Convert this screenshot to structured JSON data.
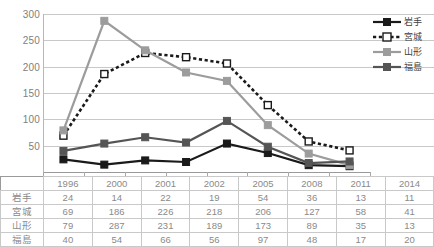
{
  "chart_data": {
    "type": "line",
    "title": "",
    "xlabel": "",
    "ylabel": "",
    "categories": [
      "1996",
      "2000",
      "2001",
      "2002",
      "2005",
      "2008",
      "2011",
      "2014"
    ],
    "ylim": [
      0,
      300
    ],
    "yticks": [
      50,
      100,
      150,
      200,
      250,
      300
    ],
    "grid": true,
    "legend_position": "right",
    "series": [
      {
        "name": "岩手",
        "values": [
          24,
          14,
          22,
          19,
          54,
          36,
          13,
          11
        ],
        "color": "#1a1a1a",
        "style": "solid",
        "marker": "filled-square"
      },
      {
        "name": "宮城",
        "values": [
          69,
          186,
          226,
          218,
          206,
          127,
          58,
          41
        ],
        "color": "#1a1a1a",
        "style": "dotted",
        "marker": "open-square"
      },
      {
        "name": "山形",
        "values": [
          79,
          287,
          231,
          189,
          173,
          89,
          35,
          13
        ],
        "color": "#9c9c9c",
        "style": "solid",
        "marker": "filled-square"
      },
      {
        "name": "福島",
        "values": [
          40,
          54,
          66,
          56,
          97,
          48,
          17,
          20
        ],
        "color": "#555555",
        "style": "solid",
        "marker": "filled-square"
      }
    ]
  },
  "legend": {
    "items": [
      {
        "label": "岩手"
      },
      {
        "label": "宮城"
      },
      {
        "label": "山形"
      },
      {
        "label": "福島"
      }
    ]
  },
  "table": {
    "corner_label": "",
    "columns": [
      "1996",
      "2000",
      "2001",
      "2002",
      "2005",
      "2008",
      "2011",
      "2014"
    ],
    "rows": [
      {
        "label": "岩手",
        "values": [
          "24",
          "14",
          "22",
          "19",
          "54",
          "36",
          "13",
          "11"
        ]
      },
      {
        "label": "宮城",
        "values": [
          "69",
          "186",
          "226",
          "218",
          "206",
          "127",
          "58",
          "41"
        ]
      },
      {
        "label": "山形",
        "values": [
          "79",
          "287",
          "231",
          "189",
          "173",
          "89",
          "35",
          "13"
        ]
      },
      {
        "label": "福島",
        "values": [
          "40",
          "54",
          "66",
          "56",
          "97",
          "48",
          "17",
          "20"
        ]
      }
    ]
  },
  "axis": {
    "ylabels": [
      "300",
      "250",
      "200",
      "150",
      "100",
      "50"
    ]
  }
}
